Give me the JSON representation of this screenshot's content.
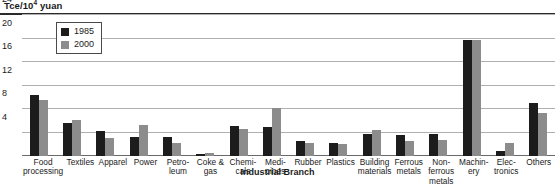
{
  "chart_data": {
    "type": "bar",
    "title": "",
    "ylabel": "Tce/10⁴ yuan",
    "ylabel_main": "Tce/10",
    "ylabel_sup": "4",
    "ylabel_tail": " yuan",
    "xlabel": "Industrial Branch",
    "ylim": [
      0,
      24
    ],
    "grid": true,
    "legend_position": "top-left",
    "yticks": [
      24,
      20,
      16,
      12,
      8,
      4
    ],
    "ytick_labels": [
      "24",
      "20",
      "16",
      "12",
      "8",
      "4"
    ],
    "categories": [
      "Food processing",
      "Textiles",
      "Apparel",
      "Power",
      "Petro-leum",
      "Coke & gas",
      "Chemi-cals",
      "Medi-cines",
      "Rubber",
      "Plastics",
      "Building materials",
      "Ferrous metals",
      "Non-ferrous metals",
      "Machin-ery",
      "Elec-tronics",
      "Others"
    ],
    "category_lines": [
      [
        "Food",
        "processing"
      ],
      [
        "Textiles"
      ],
      [
        "Apparel"
      ],
      [
        "Power"
      ],
      [
        "Petro-",
        "leum"
      ],
      [
        "Coke &",
        "gas"
      ],
      [
        "Chemi-",
        "cals"
      ],
      [
        "Medi-",
        "cines"
      ],
      [
        "Rubber"
      ],
      [
        "Plastics"
      ],
      [
        "Building",
        "materials"
      ],
      [
        "Ferrous",
        "metals"
      ],
      [
        "Non-",
        "ferrous",
        "metals"
      ],
      [
        "Machin-",
        "ery"
      ],
      [
        "Elec-",
        "tronics"
      ],
      [
        "Others"
      ]
    ],
    "series": [
      {
        "name": "1985",
        "color": "#1c1c1c",
        "values": [
          10.4,
          5.6,
          4.2,
          3.2,
          3.2,
          0.4,
          5.1,
          5.0,
          2.5,
          2.2,
          3.8,
          3.5,
          3.8,
          19.8,
          0.9,
          9.0
        ]
      },
      {
        "name": "2000",
        "color": "#8c8c8c",
        "values": [
          9.6,
          6.1,
          3.1,
          5.3,
          2.3,
          0.5,
          4.6,
          8.2,
          2.2,
          2.0,
          4.5,
          2.5,
          2.8,
          19.8,
          2.3,
          7.3
        ]
      }
    ]
  },
  "legend": {
    "items": [
      {
        "label": "1985",
        "color": "#1c1c1c"
      },
      {
        "label": "2000",
        "color": "#8c8c8c"
      }
    ]
  }
}
